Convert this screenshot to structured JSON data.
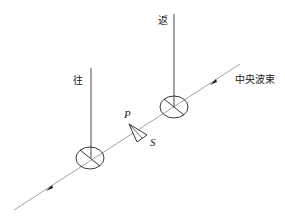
{
  "diagram": {
    "labels": {
      "outgoing": "往",
      "return": "返",
      "central_beam": "中央波束",
      "point_p": "P",
      "point_s": "S"
    },
    "elements": [
      {
        "type": "line",
        "name": "central-beam-axis"
      },
      {
        "type": "antenna",
        "name": "outgoing-antenna",
        "label": "往"
      },
      {
        "type": "antenna",
        "name": "return-antenna",
        "label": "返"
      },
      {
        "type": "triangle",
        "name": "target-ps",
        "vertices": [
          "P",
          "S"
        ]
      }
    ],
    "colors": {
      "line": "#888888",
      "stroke": "#222222"
    }
  }
}
